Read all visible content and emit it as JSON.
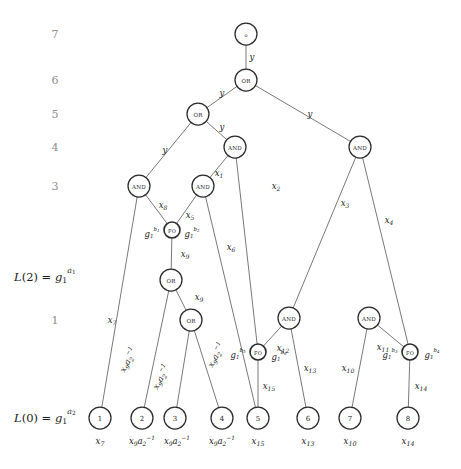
{
  "figure": {
    "type": "circuit-dag-diagram",
    "width": 461,
    "height": 469,
    "stroke_color": "#555555",
    "node_stroke_color": "#2b2b2b",
    "level_label_color": "#8d8d8d"
  },
  "level_labels": [
    {
      "name": "level-7",
      "text": "7",
      "x": 55,
      "y": 34
    },
    {
      "name": "level-6",
      "text": "6",
      "x": 55,
      "y": 80
    },
    {
      "name": "level-5",
      "text": "5",
      "x": 55,
      "y": 114
    },
    {
      "name": "level-4",
      "text": "4",
      "x": 55,
      "y": 147
    },
    {
      "name": "level-3",
      "text": "3",
      "x": 55,
      "y": 186
    },
    {
      "name": "level-1",
      "text": "1",
      "x": 55,
      "y": 320
    }
  ],
  "side_labels": [
    {
      "name": "label-L2",
      "parts": [
        {
          "t": "L",
          "style": "it"
        },
        {
          "t": "(2) = ",
          "style": "rm"
        },
        {
          "t": "g",
          "style": "it"
        },
        {
          "t": "1",
          "style": "sub"
        },
        {
          "t": "a",
          "style": "sup-it"
        },
        {
          "t": "1",
          "style": "supsub"
        }
      ],
      "plain": "L(2) = g_1^{a_1}",
      "x": 14,
      "y": 277
    },
    {
      "name": "label-L0",
      "parts": [
        {
          "t": "L",
          "style": "it"
        },
        {
          "t": "(0) = ",
          "style": "rm"
        },
        {
          "t": "g",
          "style": "it"
        },
        {
          "t": "1",
          "style": "sub"
        },
        {
          "t": "a",
          "style": "sup-it"
        },
        {
          "t": "2",
          "style": "supsub"
        }
      ],
      "plain": "L(0) = g_1^{a_2}",
      "x": 14,
      "y": 418
    }
  ],
  "nodes": [
    {
      "id": "root",
      "name": "node-root-output",
      "label": "o",
      "kind": "output",
      "x": 246,
      "y": 34,
      "r": 11
    },
    {
      "id": "or6",
      "name": "node-or-level6",
      "label": "OR",
      "kind": "gate",
      "x": 246,
      "y": 80,
      "r": 11
    },
    {
      "id": "or5",
      "name": "node-or-level5",
      "label": "OR",
      "kind": "gate",
      "x": 198,
      "y": 114,
      "r": 11
    },
    {
      "id": "and4a",
      "name": "node-and-level4-left",
      "label": "AND",
      "kind": "gate",
      "x": 235,
      "y": 147,
      "r": 11
    },
    {
      "id": "and4b",
      "name": "node-and-level4-right",
      "label": "AND",
      "kind": "gate",
      "x": 360,
      "y": 147,
      "r": 11
    },
    {
      "id": "and3a",
      "name": "node-and-level3-left",
      "label": "AND",
      "kind": "gate",
      "x": 139,
      "y": 186,
      "r": 11
    },
    {
      "id": "and3b",
      "name": "node-and-level3-right",
      "label": "AND",
      "kind": "gate",
      "x": 203,
      "y": 186,
      "r": 11
    },
    {
      "id": "fo1",
      "name": "node-fo-upper",
      "label": "FO",
      "kind": "fanout",
      "x": 172,
      "y": 230,
      "r": 8
    },
    {
      "id": "or2",
      "name": "node-or-level2",
      "label": "OR",
      "kind": "gate",
      "x": 171,
      "y": 280,
      "r": 11
    },
    {
      "id": "or1",
      "name": "node-or-level1",
      "label": "OR",
      "kind": "gate",
      "x": 191,
      "y": 320,
      "r": 11
    },
    {
      "id": "and1a",
      "name": "node-and-level1-mid",
      "label": "AND",
      "kind": "gate",
      "x": 289,
      "y": 318,
      "r": 11
    },
    {
      "id": "and1b",
      "name": "node-and-level1-right",
      "label": "AND",
      "kind": "gate",
      "x": 369,
      "y": 318,
      "r": 11
    },
    {
      "id": "fo2",
      "name": "node-fo-mid",
      "label": "FO",
      "kind": "fanout",
      "x": 258,
      "y": 352,
      "r": 8
    },
    {
      "id": "fo3",
      "name": "node-fo-right",
      "label": "FO",
      "kind": "fanout",
      "x": 410,
      "y": 352,
      "r": 8
    },
    {
      "id": "leaf1",
      "name": "node-leaf-1",
      "label": "1",
      "kind": "leaf",
      "x": 100,
      "y": 418,
      "r": 11
    },
    {
      "id": "leaf2",
      "name": "node-leaf-2",
      "label": "2",
      "kind": "leaf",
      "x": 142,
      "y": 418,
      "r": 11
    },
    {
      "id": "leaf3",
      "name": "node-leaf-3",
      "label": "3",
      "kind": "leaf",
      "x": 175,
      "y": 418,
      "r": 11
    },
    {
      "id": "leaf4",
      "name": "node-leaf-4",
      "label": "4",
      "kind": "leaf",
      "x": 222,
      "y": 418,
      "r": 11
    },
    {
      "id": "leaf5",
      "name": "node-leaf-5",
      "label": "5",
      "kind": "leaf",
      "x": 258,
      "y": 418,
      "r": 11
    },
    {
      "id": "leaf6",
      "name": "node-leaf-6",
      "label": "6",
      "kind": "leaf",
      "x": 308,
      "y": 418,
      "r": 11
    },
    {
      "id": "leaf7",
      "name": "node-leaf-7",
      "label": "7",
      "kind": "leaf",
      "x": 350,
      "y": 418,
      "r": 11
    },
    {
      "id": "leaf8",
      "name": "node-leaf-8",
      "label": "8",
      "kind": "leaf",
      "x": 408,
      "y": 418,
      "r": 11
    }
  ],
  "edges": [
    {
      "name": "edge-root-or6",
      "from": "root",
      "to": "or6"
    },
    {
      "name": "edge-or6-or5",
      "from": "or6",
      "to": "or5"
    },
    {
      "name": "edge-or6-and4b",
      "from": "or6",
      "to": "and4b"
    },
    {
      "name": "edge-or5-and3a",
      "from": "or5",
      "to": "and3a"
    },
    {
      "name": "edge-or5-and4a",
      "from": "or5",
      "to": "and4a"
    },
    {
      "name": "edge-and4a-and3b",
      "from": "and4a",
      "to": "and3b"
    },
    {
      "name": "edge-and4a-fo2",
      "from": "and4a",
      "to": "fo2"
    },
    {
      "name": "edge-and4b-and1a",
      "from": "and4b",
      "to": "and1a"
    },
    {
      "name": "edge-and4b-fo3",
      "from": "and4b",
      "to": "fo3"
    },
    {
      "name": "edge-and3a-leaf1",
      "from": "and3a",
      "to": "leaf1"
    },
    {
      "name": "edge-and3a-fo1",
      "from": "and3a",
      "to": "fo1"
    },
    {
      "name": "edge-and3b-fo1",
      "from": "and3b",
      "to": "fo1"
    },
    {
      "name": "edge-and3b-leaf5",
      "from": "and3b",
      "to": "leaf5"
    },
    {
      "name": "edge-fo1-or2",
      "from": "fo1",
      "to": "or2"
    },
    {
      "name": "edge-or2-leaf2",
      "from": "or2",
      "to": "leaf2"
    },
    {
      "name": "edge-or2-or1",
      "from": "or2",
      "to": "or1"
    },
    {
      "name": "edge-or1-leaf3",
      "from": "or1",
      "to": "leaf3"
    },
    {
      "name": "edge-or1-leaf4",
      "from": "or1",
      "to": "leaf4"
    },
    {
      "name": "edge-and1a-fo2",
      "from": "and1a",
      "to": "fo2"
    },
    {
      "name": "edge-and1a-leaf6",
      "from": "and1a",
      "to": "leaf6"
    },
    {
      "name": "edge-and1b-leaf7",
      "from": "and1b",
      "to": "leaf7"
    },
    {
      "name": "edge-and1b-fo3",
      "from": "and1b",
      "to": "fo3"
    },
    {
      "name": "edge-fo2-leaf5",
      "from": "fo2",
      "to": "leaf5"
    },
    {
      "name": "edge-fo3-leaf8",
      "from": "fo3",
      "to": "leaf8"
    }
  ],
  "edge_labels": [
    {
      "name": "edge-label-y-root",
      "base": "y",
      "sub": "",
      "sup": "",
      "x": 252,
      "y": 57,
      "plain": "y"
    },
    {
      "name": "edge-label-y-or5",
      "base": "y",
      "sub": "",
      "sup": "",
      "x": 222,
      "y": 93,
      "plain": "y"
    },
    {
      "name": "edge-label-y-and4b",
      "base": "y",
      "sub": "",
      "sup": "",
      "x": 310,
      "y": 114,
      "plain": "y"
    },
    {
      "name": "edge-label-y-and4a",
      "base": "y",
      "sub": "",
      "sup": "",
      "x": 222,
      "y": 127,
      "plain": "y"
    },
    {
      "name": "edge-label-y-and3a",
      "base": "y",
      "sub": "",
      "sup": "",
      "x": 165,
      "y": 150,
      "plain": "y"
    },
    {
      "name": "edge-label-x1",
      "base": "x",
      "sub": "1",
      "sup": "",
      "x": 219,
      "y": 173,
      "plain": "x1"
    },
    {
      "name": "edge-label-x2",
      "base": "x",
      "sub": "2",
      "sup": "",
      "x": 276,
      "y": 186,
      "plain": "x2"
    },
    {
      "name": "edge-label-x3",
      "base": "x",
      "sub": "3",
      "sup": "",
      "x": 345,
      "y": 203,
      "plain": "x3"
    },
    {
      "name": "edge-label-x4",
      "base": "x",
      "sub": "4",
      "sup": "",
      "x": 389,
      "y": 220,
      "plain": "x4"
    },
    {
      "name": "edge-label-x8",
      "base": "x",
      "sub": "8",
      "sup": "",
      "x": 163,
      "y": 205,
      "plain": "x8"
    },
    {
      "name": "edge-label-x5",
      "base": "x",
      "sub": "5",
      "sup": "",
      "x": 190,
      "y": 215,
      "plain": "x5"
    },
    {
      "name": "edge-label-x6",
      "base": "x",
      "sub": "6",
      "sup": "",
      "x": 231,
      "y": 247,
      "plain": "x6"
    },
    {
      "name": "edge-label-x9-upper",
      "base": "x",
      "sub": "9",
      "sup": "",
      "x": 185,
      "y": 254,
      "plain": "x9"
    },
    {
      "name": "edge-label-x9-lower",
      "base": "x",
      "sub": "9",
      "sup": "",
      "x": 199,
      "y": 297,
      "plain": "x9"
    },
    {
      "name": "edge-label-x7",
      "base": "x",
      "sub": "7",
      "sup": "",
      "x": 112,
      "y": 320,
      "plain": "x7"
    },
    {
      "name": "edge-label-x12",
      "base": "x",
      "sub": "12",
      "sup": "",
      "x": 283,
      "y": 348,
      "plain": "x12"
    },
    {
      "name": "edge-label-x13",
      "base": "x",
      "sub": "13",
      "sup": "",
      "x": 310,
      "y": 368,
      "plain": "x13"
    },
    {
      "name": "edge-label-x11",
      "base": "x",
      "sub": "11",
      "sup": "",
      "x": 383,
      "y": 347,
      "plain": "x11"
    },
    {
      "name": "edge-label-x10",
      "base": "x",
      "sub": "10",
      "sup": "",
      "x": 348,
      "y": 368,
      "plain": "x10"
    },
    {
      "name": "edge-label-x15",
      "base": "x",
      "sub": "15",
      "sup": "",
      "x": 269,
      "y": 386,
      "plain": "x15"
    },
    {
      "name": "edge-label-x14",
      "base": "x",
      "sub": "14",
      "sup": "",
      "x": 421,
      "y": 386,
      "plain": "x14"
    }
  ],
  "edge_labels_inverse": [
    {
      "name": "edge-label-x9a2inv-a",
      "x": 128,
      "y": 360,
      "plain": "x9 a2^-1"
    },
    {
      "name": "edge-label-x9a2inv-b",
      "x": 161,
      "y": 377,
      "plain": "x9 a2^-1"
    },
    {
      "name": "edge-label-x9a2inv-c",
      "x": 216,
      "y": 355,
      "plain": "x9 a2^-1"
    }
  ],
  "fanout_labels": [
    {
      "name": "fo-label-b1",
      "x": 152,
      "y": 234,
      "sup": "b",
      "supsub": "1",
      "plain": "g_1^{b_1}"
    },
    {
      "name": "fo-label-b2",
      "x": 192,
      "y": 234,
      "sup": "b",
      "supsub": "2",
      "plain": "g_1^{b_2}"
    },
    {
      "name": "fo-label-b5",
      "x": 238,
      "y": 355,
      "sup": "b",
      "supsub": "5",
      "plain": "g_1^{b_5}"
    },
    {
      "name": "fo-label-b6",
      "x": 279,
      "y": 357,
      "sup": "b",
      "supsub": "6",
      "plain": "g_1^{b_6}"
    },
    {
      "name": "fo-label-b3",
      "x": 390,
      "y": 355,
      "sup": "b",
      "supsub": "3",
      "plain": "g_1^{b_3}"
    },
    {
      "name": "fo-label-b4",
      "x": 432,
      "y": 355,
      "sup": "b",
      "supsub": "4",
      "plain": "g_1^{b_4}"
    }
  ],
  "leaf_bottom_labels": [
    {
      "name": "leaf-bottom-label-1",
      "base": "x",
      "sub": "7",
      "inv": false,
      "x": 100,
      "y": 441,
      "plain": "x7"
    },
    {
      "name": "leaf-bottom-label-2",
      "base": "x",
      "sub": "9",
      "inv": true,
      "x": 142,
      "y": 441,
      "plain": "x9 a2^-1"
    },
    {
      "name": "leaf-bottom-label-3",
      "base": "x",
      "sub": "9",
      "inv": true,
      "x": 177,
      "y": 441,
      "plain": "x9 a2^-1"
    },
    {
      "name": "leaf-bottom-label-4",
      "base": "x",
      "sub": "9",
      "inv": true,
      "x": 222,
      "y": 441,
      "plain": "x9 a2^-1"
    },
    {
      "name": "leaf-bottom-label-5",
      "base": "x",
      "sub": "15",
      "inv": false,
      "x": 258,
      "y": 441,
      "plain": "x15"
    },
    {
      "name": "leaf-bottom-label-6",
      "base": "x",
      "sub": "13",
      "inv": false,
      "x": 308,
      "y": 441,
      "plain": "x13"
    },
    {
      "name": "leaf-bottom-label-7",
      "base": "x",
      "sub": "10",
      "inv": false,
      "x": 350,
      "y": 441,
      "plain": "x10"
    },
    {
      "name": "leaf-bottom-label-8",
      "base": "x",
      "sub": "14",
      "inv": false,
      "x": 408,
      "y": 441,
      "plain": "x14"
    }
  ]
}
